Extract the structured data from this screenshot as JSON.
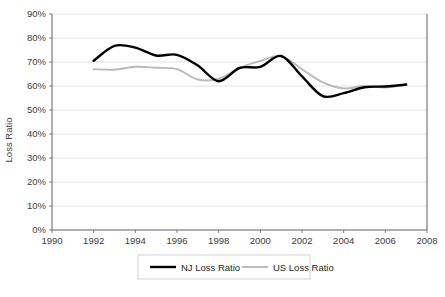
{
  "chart_data": {
    "type": "line",
    "title": "",
    "subtitle": "",
    "xlabel": "",
    "ylabel": "Loss Ratio",
    "xlim": [
      1990,
      2008
    ],
    "ylim": [
      0,
      0.9
    ],
    "grid": "horizontal",
    "legend_position": "bottom",
    "x_tick_labels": [
      "1990",
      "1992",
      "1994",
      "1996",
      "1998",
      "2000",
      "2002",
      "2004",
      "2006",
      "2008"
    ],
    "x_ticks": [
      1990,
      1992,
      1994,
      1996,
      1998,
      2000,
      2002,
      2004,
      2006,
      2008
    ],
    "y_tick_labels": [
      "0%",
      "10%",
      "20%",
      "30%",
      "40%",
      "50%",
      "60%",
      "70%",
      "80%",
      "90%"
    ],
    "y_ticks": [
      0,
      10,
      20,
      30,
      40,
      50,
      60,
      70,
      80,
      90
    ],
    "x": [
      1992,
      1993,
      1994,
      1995,
      1996,
      1997,
      1998,
      1999,
      2000,
      2001,
      2002,
      2003,
      2004,
      2005,
      2006,
      2007
    ],
    "series": [
      {
        "name": "NJ Loss Ratio",
        "color": "#000000",
        "values": [
          70.5,
          76.7,
          76.0,
          72.7,
          73.0,
          68.5,
          62.0,
          67.5,
          68.0,
          72.5,
          64.0,
          55.8,
          57.0,
          59.5,
          59.8,
          60.6
        ]
      },
      {
        "name": "US Loss Ratio",
        "color": "#b9b9b9",
        "values": [
          67.0,
          66.8,
          68.0,
          67.6,
          67.0,
          62.7,
          63.0,
          67.5,
          70.5,
          72.4,
          67.0,
          61.5,
          59.0,
          60.0,
          59.4,
          60.6
        ]
      }
    ]
  },
  "axes": {
    "y_axis_title": "Loss Ratio"
  },
  "legend": {
    "items": [
      {
        "label": "NJ Loss Ratio",
        "color": "#000000",
        "swatch": "line-swatch-nj"
      },
      {
        "label": "US Loss Ratio",
        "color": "#b9b9b9",
        "swatch": "line-swatch-us"
      }
    ]
  },
  "caption": {
    "cut_off_text": ""
  }
}
